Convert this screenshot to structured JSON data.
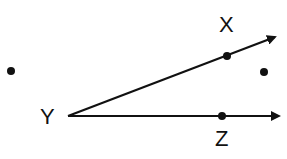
{
  "diagram": {
    "type": "geometry-angle",
    "vertex": {
      "label": "Y",
      "x": 68,
      "y": 116
    },
    "rays": [
      {
        "name": "ray-YX",
        "through": "X",
        "tip": {
          "x": 277,
          "y": 36
        }
      },
      {
        "name": "ray-YZ",
        "through": "Z",
        "tip": {
          "x": 281,
          "y": 116
        }
      }
    ],
    "points": [
      {
        "label": "X",
        "x": 227,
        "y": 56
      },
      {
        "label": "Z",
        "x": 222,
        "y": 116
      }
    ],
    "extra_points": [
      {
        "name": "left-point",
        "x": 11,
        "y": 71
      },
      {
        "name": "right-point",
        "x": 264,
        "y": 72
      }
    ],
    "labels": {
      "X": "X",
      "Y": "Y",
      "Z": "Z"
    },
    "colors": {
      "stroke": "#111111",
      "background": "#ffffff"
    }
  }
}
